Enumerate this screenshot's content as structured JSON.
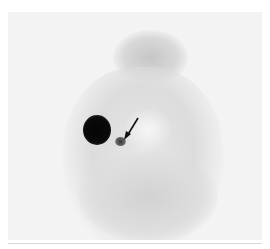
{
  "image": {
    "description": "Grayscale scintigraphy scan with a dark focal uptake, a smaller adjacent focus, and an arrow pointing to the small focus",
    "annotation": {
      "type": "arrow",
      "target": "small-focus"
    },
    "colors": {
      "background": "#f3f3f3",
      "dark_focus": "#0a0a0a",
      "small_focus": "#555555",
      "soft_tissue": "#c8c8c8"
    }
  }
}
